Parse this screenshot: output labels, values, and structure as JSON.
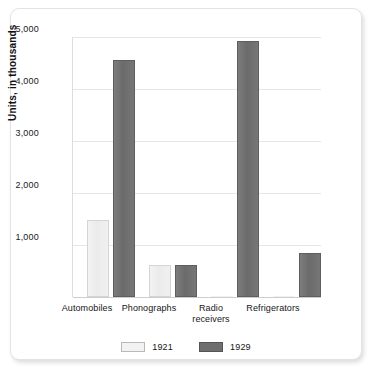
{
  "chart_data": {
    "type": "bar",
    "title": "",
    "subtitle": "",
    "xlabel": "",
    "ylabel": "Units, in thousands",
    "categories": [
      "Automobiles",
      "Phonographs",
      "Radio receivers",
      "Refrigerators"
    ],
    "category_lines": [
      [
        "Automobiles"
      ],
      [
        "Phonographs"
      ],
      [
        "Radio",
        "receivers"
      ],
      [
        "Refrigerators"
      ]
    ],
    "series": [
      {
        "name": "1921",
        "values": [
          1480,
          615,
          10,
          5
        ],
        "color": "#f0f0f0"
      },
      {
        "name": "1929",
        "values": [
          4550,
          610,
          4930,
          845
        ],
        "color": "#6e6e6e"
      }
    ],
    "ylim": [
      0,
      5000
    ],
    "yticks": [
      1000,
      2000,
      3000,
      4000,
      5000
    ],
    "ytick_labels": [
      "1,000",
      "2,000",
      "3,000",
      "4,000",
      "5,000"
    ],
    "grid": true,
    "legend_position": "bottom",
    "legend": [
      "1921",
      "1929"
    ]
  },
  "axis": {
    "y_label": "Units, in thousands",
    "ticks": [
      {
        "value": 5000,
        "label": "5,000"
      },
      {
        "value": 4000,
        "label": "4,000"
      },
      {
        "value": 3000,
        "label": "3,000"
      },
      {
        "value": 2000,
        "label": "2,000"
      },
      {
        "value": 1000,
        "label": "1,000"
      }
    ]
  },
  "categories": [
    {
      "line1": "Automobiles",
      "line2": ""
    },
    {
      "line1": "Phonographs",
      "line2": ""
    },
    {
      "line1": "Radio",
      "line2": "receivers"
    },
    {
      "line1": "Refrigerators",
      "line2": ""
    }
  ],
  "legend": {
    "items": [
      {
        "label": "1921",
        "color": "#f0f0f0"
      },
      {
        "label": "1929",
        "color": "#6e6e6e"
      }
    ]
  }
}
